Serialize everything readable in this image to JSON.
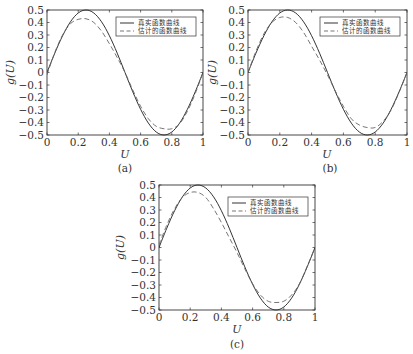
{
  "chart_data": [
    {
      "type": "line",
      "panel": "(a)",
      "caption": "(a)",
      "xlabel": "U",
      "ylabel": "g(U)",
      "xlim": [
        0,
        1
      ],
      "ylim": [
        -0.5,
        0.5
      ],
      "xticks": [
        "0",
        "0.2",
        "0.4",
        "0.6",
        "0.8",
        "1"
      ],
      "yticks": [
        "0.5",
        "0.4",
        "0.3",
        "0.2",
        "0.1",
        "0",
        "-0.1",
        "-0.2",
        "-0.3",
        "-0.4",
        "-0.5"
      ],
      "legend": [
        "真实函数曲线",
        "估计的函数曲线"
      ],
      "legend_position": "upper right",
      "grid": false,
      "series": [
        {
          "name": "真实函数曲线",
          "style": "solid",
          "x": [
            0,
            0.05,
            0.1,
            0.15,
            0.2,
            0.25,
            0.3,
            0.35,
            0.4,
            0.45,
            0.5,
            0.55,
            0.6,
            0.65,
            0.7,
            0.75,
            0.8,
            0.85,
            0.9,
            0.95,
            1.0
          ],
          "values": [
            0,
            0.155,
            0.294,
            0.405,
            0.476,
            0.5,
            0.476,
            0.405,
            0.294,
            0.155,
            0,
            -0.155,
            -0.294,
            -0.405,
            -0.476,
            -0.5,
            -0.476,
            -0.405,
            -0.294,
            -0.155,
            0
          ]
        },
        {
          "name": "估计的函数曲线",
          "style": "dashed",
          "x": [
            0,
            0.05,
            0.1,
            0.15,
            0.2,
            0.25,
            0.3,
            0.35,
            0.4,
            0.45,
            0.5,
            0.55,
            0.6,
            0.65,
            0.7,
            0.75,
            0.8,
            0.85,
            0.9,
            0.95,
            1.0
          ],
          "values": [
            -0.02,
            0.16,
            0.3,
            0.39,
            0.425,
            0.43,
            0.4,
            0.33,
            0.23,
            0.12,
            0.0,
            -0.14,
            -0.27,
            -0.37,
            -0.43,
            -0.45,
            -0.45,
            -0.41,
            -0.31,
            -0.17,
            0.0
          ]
        }
      ]
    },
    {
      "type": "line",
      "panel": "(b)",
      "caption": "(b)",
      "xlabel": "U",
      "ylabel": "g(U)",
      "xlim": [
        0,
        1
      ],
      "ylim": [
        -0.5,
        0.5
      ],
      "xticks": [
        "0",
        "0.2",
        "0.4",
        "0.6",
        "0.8",
        "1"
      ],
      "yticks": [
        "0.5",
        "0.4",
        "0.3",
        "0.2",
        "0.1",
        "0",
        "-0.1",
        "-0.2",
        "-0.3",
        "-0.4",
        "-0.5"
      ],
      "legend": [
        "真实函数曲线",
        "估计的函数曲线"
      ],
      "legend_position": "upper right",
      "grid": false,
      "series": [
        {
          "name": "真实函数曲线",
          "style": "solid",
          "x": [
            0,
            0.05,
            0.1,
            0.15,
            0.2,
            0.25,
            0.3,
            0.35,
            0.4,
            0.45,
            0.5,
            0.55,
            0.6,
            0.65,
            0.7,
            0.75,
            0.8,
            0.85,
            0.9,
            0.95,
            1.0
          ],
          "values": [
            0,
            0.155,
            0.294,
            0.405,
            0.476,
            0.5,
            0.476,
            0.405,
            0.294,
            0.155,
            0,
            -0.155,
            -0.294,
            -0.405,
            -0.476,
            -0.5,
            -0.476,
            -0.405,
            -0.294,
            -0.155,
            0
          ]
        },
        {
          "name": "估计的函数曲线",
          "style": "dashed",
          "x": [
            0,
            0.05,
            0.1,
            0.15,
            0.2,
            0.25,
            0.3,
            0.35,
            0.4,
            0.45,
            0.5,
            0.55,
            0.6,
            0.65,
            0.7,
            0.75,
            0.8,
            0.85,
            0.9,
            0.95,
            1.0
          ],
          "values": [
            0.0,
            0.17,
            0.31,
            0.4,
            0.44,
            0.44,
            0.4,
            0.32,
            0.21,
            0.1,
            -0.02,
            -0.15,
            -0.27,
            -0.37,
            -0.42,
            -0.44,
            -0.44,
            -0.39,
            -0.3,
            -0.16,
            0.0
          ]
        }
      ]
    },
    {
      "type": "line",
      "panel": "(c)",
      "caption": "(c)",
      "xlabel": "U",
      "ylabel": "g(U)",
      "xlim": [
        0,
        1
      ],
      "ylim": [
        -0.5,
        0.5
      ],
      "xticks": [
        "0",
        "0.2",
        "0.4",
        "0.6",
        "0.8",
        "1"
      ],
      "yticks": [
        "0.5",
        "0.4",
        "0.3",
        "0.2",
        "0.1",
        "0",
        "-0.1",
        "-0.2",
        "-0.3",
        "-0.4",
        "-0.5"
      ],
      "legend": [
        "真实函数曲线",
        "估计的函数曲线"
      ],
      "legend_position": "upper right",
      "grid": false,
      "series": [
        {
          "name": "真实函数曲线",
          "style": "solid",
          "x": [
            0,
            0.05,
            0.1,
            0.15,
            0.2,
            0.25,
            0.3,
            0.35,
            0.4,
            0.45,
            0.5,
            0.55,
            0.6,
            0.65,
            0.7,
            0.75,
            0.8,
            0.85,
            0.9,
            0.95,
            1.0
          ],
          "values": [
            0,
            0.155,
            0.294,
            0.405,
            0.476,
            0.5,
            0.476,
            0.405,
            0.294,
            0.155,
            0,
            -0.155,
            -0.294,
            -0.405,
            -0.476,
            -0.5,
            -0.476,
            -0.405,
            -0.294,
            -0.155,
            0
          ]
        },
        {
          "name": "估计的函数曲线",
          "style": "dashed",
          "x": [
            0,
            0.05,
            0.1,
            0.15,
            0.2,
            0.25,
            0.3,
            0.35,
            0.4,
            0.45,
            0.5,
            0.55,
            0.6,
            0.65,
            0.7,
            0.75,
            0.8,
            0.85,
            0.9,
            0.95,
            1.0
          ],
          "values": [
            0.02,
            0.18,
            0.31,
            0.4,
            0.44,
            0.44,
            0.4,
            0.31,
            0.2,
            0.08,
            -0.04,
            -0.17,
            -0.29,
            -0.38,
            -0.43,
            -0.44,
            -0.43,
            -0.38,
            -0.29,
            -0.15,
            0.0
          ]
        }
      ]
    }
  ],
  "panels": {
    "a": {
      "caption": "(a)",
      "xlabel": "U",
      "ylabel": "g(U)",
      "legend_true": "真实函数曲线",
      "legend_est": "估计的函数曲线"
    },
    "b": {
      "caption": "(b)",
      "xlabel": "U",
      "ylabel": "g(U)",
      "legend_true": "真实函数曲线",
      "legend_est": "估计的函数曲线"
    },
    "c": {
      "caption": "(c)",
      "xlabel": "U",
      "ylabel": "g(U)",
      "legend_true": "真实函数曲线",
      "legend_est": "估计的函数曲线"
    }
  },
  "colors": {
    "true_line": "#333333",
    "estimate_line": "#666666",
    "axes": "#333333"
  }
}
